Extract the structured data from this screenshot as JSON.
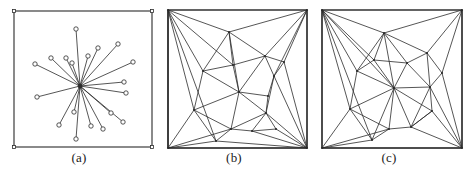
{
  "figure": {
    "background_color": "#ffffff",
    "line_color": "#2b2b2b",
    "marker_color": "#2b2b2b",
    "width": 475,
    "height": 180
  },
  "panels": [
    {
      "id": "a",
      "caption": "(a)",
      "kind": "star-graph",
      "box": {
        "x": 14,
        "y": 11,
        "w": 138,
        "h": 136
      },
      "center": {
        "x": 80,
        "y": 86
      },
      "show_markers": true,
      "marker_radius": 2.2,
      "points": [
        {
          "x": 76,
          "y": 29
        },
        {
          "x": 118,
          "y": 44
        },
        {
          "x": 98,
          "y": 48
        },
        {
          "x": 88,
          "y": 56
        },
        {
          "x": 66,
          "y": 58
        },
        {
          "x": 51,
          "y": 58
        },
        {
          "x": 133,
          "y": 62
        },
        {
          "x": 35,
          "y": 64
        },
        {
          "x": 72,
          "y": 63
        },
        {
          "x": 124,
          "y": 82
        },
        {
          "x": 126,
          "y": 93
        },
        {
          "x": 37,
          "y": 97
        },
        {
          "x": 74,
          "y": 112
        },
        {
          "x": 111,
          "y": 113
        },
        {
          "x": 123,
          "y": 122
        },
        {
          "x": 59,
          "y": 125
        },
        {
          "x": 91,
          "y": 126
        },
        {
          "x": 103,
          "y": 129
        },
        {
          "x": 76,
          "y": 139
        }
      ],
      "corner_markers": [
        {
          "x": 14,
          "y": 11
        },
        {
          "x": 152,
          "y": 11
        },
        {
          "x": 14,
          "y": 147
        },
        {
          "x": 152,
          "y": 147
        }
      ]
    },
    {
      "id": "b",
      "caption": "(b)",
      "kind": "triangulation",
      "box": {
        "x": 13,
        "y": 10,
        "w": 139,
        "h": 138
      },
      "show_markers": false,
      "vertices": [
        {
          "id": 0,
          "x": 13,
          "y": 10
        },
        {
          "id": 1,
          "x": 152,
          "y": 10
        },
        {
          "id": 2,
          "x": 13,
          "y": 148
        },
        {
          "id": 3,
          "x": 152,
          "y": 148
        },
        {
          "id": 4,
          "x": 74,
          "y": 32
        },
        {
          "id": 5,
          "x": 110,
          "y": 56
        },
        {
          "id": 6,
          "x": 48,
          "y": 71
        },
        {
          "id": 7,
          "x": 78,
          "y": 65
        },
        {
          "id": 8,
          "x": 119,
          "y": 76
        },
        {
          "id": 9,
          "x": 84,
          "y": 92
        },
        {
          "id": 10,
          "x": 39,
          "y": 110
        },
        {
          "id": 11,
          "x": 113,
          "y": 96
        },
        {
          "id": 12,
          "x": 111,
          "y": 113
        },
        {
          "id": 13,
          "x": 76,
          "y": 129
        },
        {
          "id": 14,
          "x": 97,
          "y": 131
        },
        {
          "id": 15,
          "x": 61,
          "y": 141
        },
        {
          "id": 16,
          "x": 129,
          "y": 62
        },
        {
          "id": 17,
          "x": 121,
          "y": 129
        }
      ],
      "edges": [
        [
          0,
          1
        ],
        [
          1,
          3
        ],
        [
          3,
          2
        ],
        [
          2,
          0
        ],
        [
          0,
          4
        ],
        [
          1,
          4
        ],
        [
          0,
          6
        ],
        [
          0,
          7
        ],
        [
          0,
          10
        ],
        [
          0,
          15
        ],
        [
          0,
          2
        ],
        [
          1,
          5
        ],
        [
          1,
          16
        ],
        [
          1,
          8
        ],
        [
          1,
          3
        ],
        [
          2,
          10
        ],
        [
          2,
          15
        ],
        [
          2,
          13
        ],
        [
          2,
          3
        ],
        [
          3,
          17
        ],
        [
          3,
          14
        ],
        [
          3,
          12
        ],
        [
          3,
          8
        ],
        [
          3,
          16
        ],
        [
          4,
          5
        ],
        [
          4,
          7
        ],
        [
          4,
          6
        ],
        [
          4,
          9
        ],
        [
          5,
          7
        ],
        [
          5,
          9
        ],
        [
          5,
          16
        ],
        [
          5,
          8
        ],
        [
          6,
          7
        ],
        [
          6,
          9
        ],
        [
          6,
          10
        ],
        [
          7,
          9
        ],
        [
          8,
          11
        ],
        [
          8,
          16
        ],
        [
          8,
          12
        ],
        [
          9,
          11
        ],
        [
          9,
          12
        ],
        [
          9,
          13
        ],
        [
          9,
          10
        ],
        [
          10,
          13
        ],
        [
          10,
          15
        ],
        [
          11,
          12
        ],
        [
          12,
          14
        ],
        [
          12,
          13
        ],
        [
          12,
          17
        ],
        [
          13,
          14
        ],
        [
          13,
          15
        ],
        [
          14,
          17
        ],
        [
          15,
          3
        ],
        [
          2,
          0
        ]
      ]
    },
    {
      "id": "c",
      "caption": "(c)",
      "kind": "triangulation",
      "box": {
        "x": 12,
        "y": 10,
        "w": 140,
        "h": 138
      },
      "show_markers": false,
      "vertices": [
        {
          "id": 0,
          "x": 12,
          "y": 10
        },
        {
          "id": 1,
          "x": 152,
          "y": 10
        },
        {
          "id": 2,
          "x": 12,
          "y": 148
        },
        {
          "id": 3,
          "x": 152,
          "y": 148
        },
        {
          "id": 4,
          "x": 74,
          "y": 33
        },
        {
          "id": 5,
          "x": 84,
          "y": 88
        },
        {
          "id": 6,
          "x": 47,
          "y": 71
        },
        {
          "id": 7,
          "x": 117,
          "y": 53
        },
        {
          "id": 8,
          "x": 132,
          "y": 73
        },
        {
          "id": 9,
          "x": 40,
          "y": 109
        },
        {
          "id": 10,
          "x": 120,
          "y": 87
        },
        {
          "id": 11,
          "x": 122,
          "y": 111
        },
        {
          "id": 12,
          "x": 79,
          "y": 129
        },
        {
          "id": 13,
          "x": 101,
          "y": 127
        },
        {
          "id": 14,
          "x": 62,
          "y": 140
        },
        {
          "id": 15,
          "x": 97,
          "y": 63
        },
        {
          "id": 16,
          "x": 64,
          "y": 60
        }
      ],
      "edges": [
        [
          0,
          1
        ],
        [
          1,
          3
        ],
        [
          3,
          2
        ],
        [
          2,
          0
        ],
        [
          0,
          4
        ],
        [
          1,
          4
        ],
        [
          0,
          6
        ],
        [
          0,
          16
        ],
        [
          0,
          5
        ],
        [
          0,
          9
        ],
        [
          0,
          14
        ],
        [
          0,
          2
        ],
        [
          1,
          7
        ],
        [
          1,
          8
        ],
        [
          1,
          3
        ],
        [
          2,
          9
        ],
        [
          2,
          14
        ],
        [
          2,
          12
        ],
        [
          2,
          3
        ],
        [
          3,
          11
        ],
        [
          3,
          13
        ],
        [
          3,
          10
        ],
        [
          3,
          8
        ],
        [
          4,
          16
        ],
        [
          4,
          15
        ],
        [
          4,
          5
        ],
        [
          4,
          6
        ],
        [
          4,
          7
        ],
        [
          5,
          6
        ],
        [
          5,
          9
        ],
        [
          5,
          12
        ],
        [
          5,
          13
        ],
        [
          5,
          10
        ],
        [
          5,
          15
        ],
        [
          5,
          16
        ],
        [
          5,
          11
        ],
        [
          5,
          14
        ],
        [
          6,
          9
        ],
        [
          6,
          16
        ],
        [
          7,
          8
        ],
        [
          7,
          15
        ],
        [
          7,
          10
        ],
        [
          8,
          10
        ],
        [
          9,
          12
        ],
        [
          9,
          14
        ],
        [
          10,
          11
        ],
        [
          10,
          13
        ],
        [
          11,
          13
        ],
        [
          12,
          13
        ],
        [
          12,
          14
        ],
        [
          13,
          11
        ],
        [
          15,
          10
        ],
        [
          15,
          16
        ]
      ]
    }
  ]
}
